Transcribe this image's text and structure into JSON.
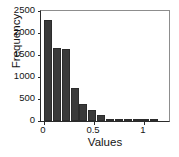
{
  "chart_data": {
    "type": "bar",
    "title": "",
    "subtitle": "",
    "xlabel": "Values",
    "ylabel": "Frequency",
    "xlim": [
      -0.03,
      1.25
    ],
    "ylim": [
      0,
      2500
    ],
    "grid": false,
    "legend": null,
    "bin_width": 0.0885,
    "bar_color": "#3a3a3a",
    "axis_color": "#2b2b2b",
    "background": "#ffffff",
    "xticks": [
      {
        "value": 0,
        "label": "0"
      },
      {
        "value": 0.5,
        "label": "0.5"
      },
      {
        "value": 1,
        "label": "1"
      }
    ],
    "yticks": [
      {
        "value": 0,
        "label": "0"
      },
      {
        "value": 500,
        "label": "500"
      },
      {
        "value": 1000,
        "label": "1000"
      },
      {
        "value": 1500,
        "label": "1500"
      },
      {
        "value": 2000,
        "label": "2000"
      },
      {
        "value": 2500,
        "label": "2500"
      }
    ],
    "categories": [
      "0.00-0.09",
      "0.09-0.18",
      "0.18-0.27",
      "0.27-0.35",
      "0.35-0.44",
      "0.44-0.53",
      "0.53-0.62",
      "0.62-0.71",
      "0.71-0.80",
      "0.80-0.88",
      "0.88-0.97",
      "0.97-1.06",
      "1.06-1.15"
    ],
    "bin_starts": [
      0.0,
      0.0885,
      0.177,
      0.2655,
      0.354,
      0.4425,
      0.531,
      0.6195,
      0.708,
      0.7965,
      0.885,
      0.9735,
      1.062
    ],
    "values": [
      2290,
      1665,
      1635,
      755,
      380,
      240,
      135,
      45,
      25,
      20,
      15,
      12,
      8
    ]
  }
}
